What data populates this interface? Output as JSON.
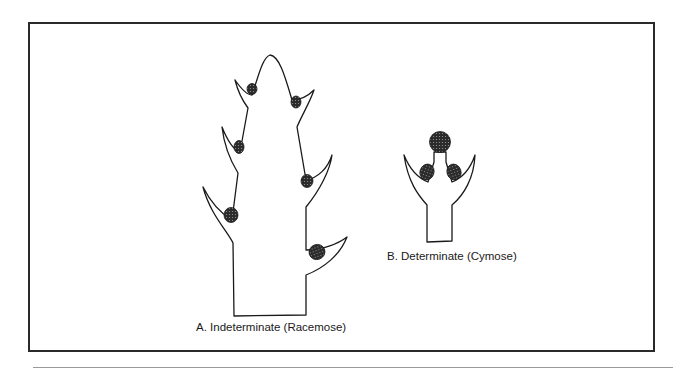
{
  "figure": {
    "panels": [
      {
        "id": "A",
        "caption": "A. Indeterminate (Racemose)"
      },
      {
        "id": "B",
        "caption": "B. Determinate (Cymose)"
      }
    ],
    "colors": {
      "line": "#1a1a1a",
      "bud_fill": "#3a3a3a",
      "frame": "#2a2a2a"
    }
  }
}
